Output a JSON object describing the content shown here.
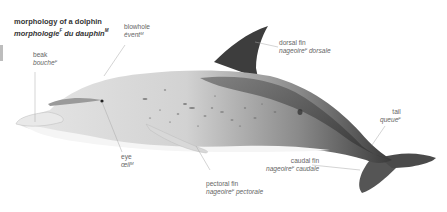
{
  "title": {
    "en": "morphology of a dolphin",
    "fr_part1": "morphologie",
    "fr_sup1": "F",
    "fr_part2": " du dauphin",
    "fr_sup2": "M"
  },
  "labels": [
    {
      "id": "blowhole",
      "en": "blowhole",
      "fr": "évent",
      "gender": "M"
    },
    {
      "id": "beak",
      "en": "beak",
      "fr": "bouche",
      "gender": "F"
    },
    {
      "id": "dorsal-fin",
      "en": "dorsal fin",
      "fr_a": "nageoire",
      "gender": "F",
      "fr_b": " dorsale"
    },
    {
      "id": "tail",
      "en": "tail",
      "fr": "queue",
      "gender": "F"
    },
    {
      "id": "eye",
      "en": "eye",
      "fr": "œil",
      "gender": "M"
    },
    {
      "id": "caudal-fin",
      "en": "caudal fin",
      "fr_a": "nageoire",
      "gender": "F",
      "fr_b": " caudale"
    },
    {
      "id": "pectoral-fin",
      "en": "pectoral fin",
      "fr_a": "nageoire",
      "gender": "F",
      "fr_b": " pectorale"
    }
  ],
  "colors": {
    "body_light": "#efefef",
    "body_mid": "#b8b8b8",
    "body_dark": "#3a3a3a",
    "leader_line": "#9a9a9a",
    "text": "#666666",
    "title_text": "#333333"
  }
}
